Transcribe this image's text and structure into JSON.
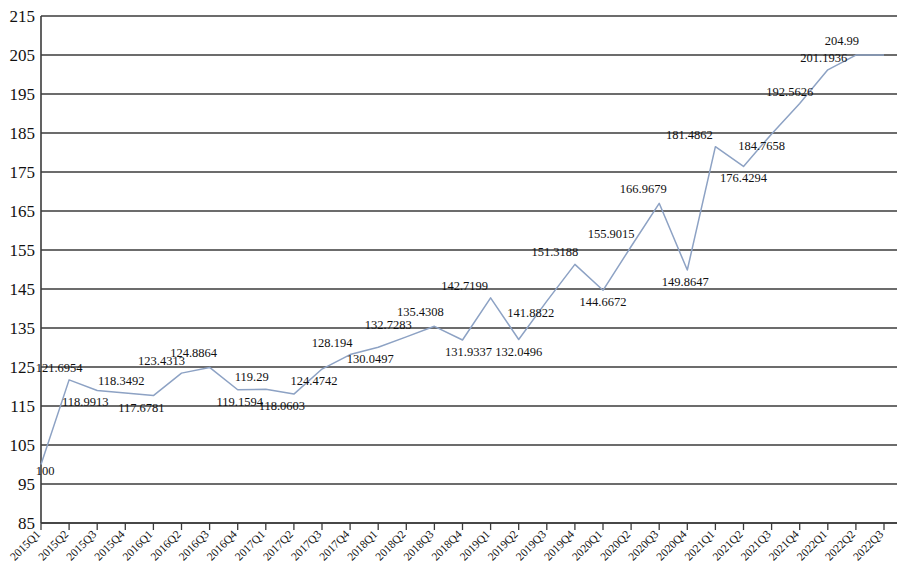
{
  "chart_data": {
    "type": "line",
    "title": "",
    "subtitle": "",
    "xlabel": "",
    "ylabel": "",
    "ylim": [
      85,
      215
    ],
    "ytick_step": 10,
    "yticks": [
      215,
      205,
      195,
      185,
      175,
      165,
      155,
      145,
      135,
      125,
      115,
      105,
      95,
      85
    ],
    "grid": "horizontal",
    "legend": "none",
    "line_color": "#8da2c4",
    "categories": [
      "2015Q1",
      "2015Q2",
      "2015Q3",
      "2015Q4",
      "2016Q1",
      "2016Q2",
      "2016Q3",
      "2016Q4",
      "2017Q1",
      "2017Q2",
      "2017Q3",
      "2017Q4",
      "2018Q1",
      "2018Q2",
      "2018Q3",
      "2018Q4",
      "2019Q1",
      "2019Q2",
      "2019Q3",
      "2019Q4",
      "2020Q1",
      "2020Q2",
      "2020Q3",
      "2020Q4",
      "2021Q1",
      "2021Q2",
      "2021Q3",
      "2021Q4",
      "2022Q1",
      "2022Q2",
      "2022Q3"
    ],
    "values": [
      100,
      121.6954,
      118.9913,
      118.3492,
      117.6781,
      123.4313,
      124.8864,
      119.1594,
      119.29,
      118.0603,
      124.4742,
      128.194,
      130.0497,
      132.7283,
      135.4308,
      131.9337,
      142.7199,
      132.0496,
      141.8822,
      151.3188,
      144.6672,
      155.9015,
      166.9679,
      149.8647,
      181.4862,
      176.4294,
      184.7658,
      192.5626,
      201.1936,
      204.99,
      204.99
    ],
    "point_labels": [
      "100",
      "121.6954",
      "118.9913",
      "118.3492",
      "117.6781",
      "123.4313",
      "124.8864",
      "119.1594",
      "119.29",
      "118.0603",
      "124.4742",
      "128.194",
      "130.0497",
      "132.7283",
      "135.4308",
      "131.9337",
      "142.7199",
      "132.0496",
      "141.8822",
      "151.3188",
      "144.6672",
      "155.9015",
      "166.9679",
      "149.8647",
      "181.4862",
      "176.4294",
      "184.7658",
      "192.5626",
      "201.1936",
      "204.99",
      ""
    ]
  }
}
